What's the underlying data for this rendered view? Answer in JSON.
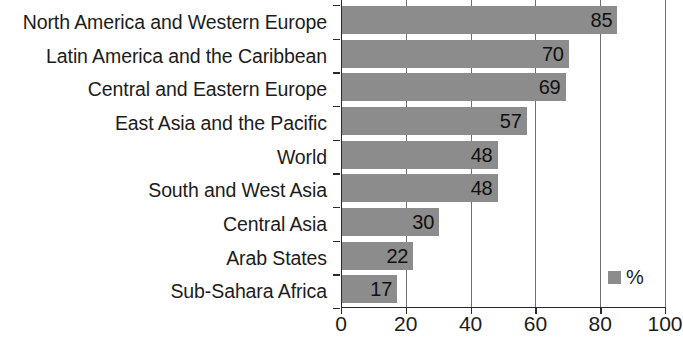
{
  "chart_data": {
    "type": "bar",
    "orientation": "horizontal",
    "title": "",
    "xlabel": "",
    "ylabel": "",
    "xlim": [
      0,
      100
    ],
    "xticks": [
      0,
      20,
      40,
      60,
      80,
      100
    ],
    "grid": true,
    "legend": {
      "position": "bottom-right",
      "entries": [
        {
          "label": "%",
          "color": "#8c8c8c"
        }
      ]
    },
    "bar_color": "#8c8c8c",
    "value_label_position": "inside-end",
    "categories": [
      "North America and Western Europe",
      "Latin America and the Caribbean",
      "Central and Eastern Europe",
      "East Asia and the Pacific",
      "World",
      "South and West Asia",
      "Central Asia",
      "Arab States",
      "Sub-Sahara Africa"
    ],
    "values": [
      85,
      70,
      69,
      57,
      48,
      48,
      30,
      22,
      17
    ],
    "value_labels": [
      "85",
      "70",
      "69",
      "57",
      "48",
      "48",
      "30",
      "22",
      "17"
    ],
    "tick_labels": [
      "0",
      "20",
      "40",
      "60",
      "80",
      "100"
    ]
  }
}
